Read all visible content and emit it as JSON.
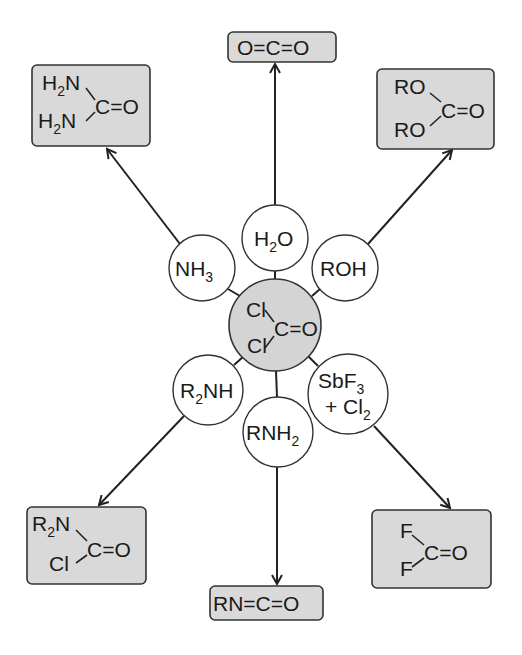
{
  "diagram": {
    "center": {
      "name": "phosgene",
      "substituents": [
        "Cl",
        "Cl"
      ],
      "core": "C=O",
      "color": "#d4d4d4"
    },
    "reagents": [
      {
        "id": "h2o",
        "label": "H",
        "sub": "2",
        "tail": "O"
      },
      {
        "id": "nh3",
        "label": "NH",
        "sub": "3"
      },
      {
        "id": "roh",
        "label": "ROH"
      },
      {
        "id": "r2nh",
        "label": "R",
        "sub": "2",
        "tail": "NH"
      },
      {
        "id": "rnh2",
        "label": "RNH",
        "sub": "2"
      },
      {
        "id": "sbf3",
        "line1": "SbF",
        "line1_sub": "3",
        "line2": "+ Cl",
        "line2_sub": "2"
      }
    ],
    "products": {
      "co2": {
        "text": "O=C=O"
      },
      "urea": {
        "top": "H",
        "top_sub": "2",
        "top_tail": "N",
        "bottom": "H",
        "bottom_sub": "2",
        "bottom_tail": "N",
        "core": "C=O"
      },
      "carbonate": {
        "top": "RO",
        "bottom": "RO",
        "core": "C=O"
      },
      "carbamoyl": {
        "top": "R",
        "top_sub": "2",
        "top_tail": "N",
        "bottom": "Cl",
        "core": "C=O"
      },
      "isocyanate": {
        "text": "RN=C=O"
      },
      "cof2": {
        "top": "F",
        "bottom": "F",
        "core": "C=O"
      }
    },
    "colors": {
      "box_fill": "#d9d9d9",
      "stroke": "#333333"
    }
  }
}
